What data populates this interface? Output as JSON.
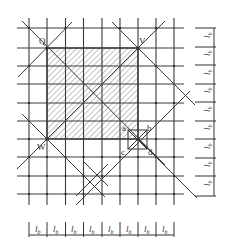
{
  "diagram": {
    "labels": {
      "Q": "Q",
      "V": "V",
      "W": "W",
      "a": "a",
      "b": "b",
      "c": "c",
      "d": "d"
    },
    "spacing_label": "l",
    "spacing_subscript": "b",
    "bottom_dimension_count": 8,
    "right_dimension_count": 9,
    "colors": {
      "line": "#3a3a3a",
      "hatch": "#555555",
      "background": "#ffffff"
    }
  }
}
